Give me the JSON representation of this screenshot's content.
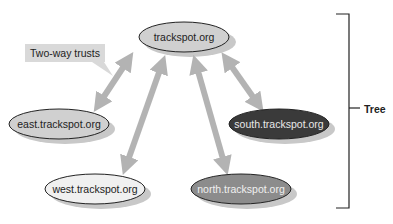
{
  "diagram": {
    "callout": "Two-way trusts",
    "bracket_label": "Tree",
    "nodes": [
      {
        "id": "root",
        "label": "trackspot.org",
        "fill": "#d0d0d0",
        "text_color": "#222222"
      },
      {
        "id": "east",
        "label": "east.trackspot.org",
        "fill": "#d0d0d0",
        "text_color": "#222222"
      },
      {
        "id": "south",
        "label": "south.trackspot.org",
        "fill": "#3a3a3a",
        "text_color": "#e8e8e8"
      },
      {
        "id": "west",
        "label": "west.trackspot.org",
        "fill": "#f0f0f0",
        "text_color": "#222222"
      },
      {
        "id": "north",
        "label": "north.trackspot.org",
        "fill": "#8c8c8c",
        "text_color": "#f0f0f0"
      }
    ],
    "edges": [
      {
        "from": "root",
        "to": "east",
        "type": "two-way"
      },
      {
        "from": "root",
        "to": "west",
        "type": "two-way"
      },
      {
        "from": "root",
        "to": "north",
        "type": "two-way"
      },
      {
        "from": "root",
        "to": "south",
        "type": "two-way"
      }
    ],
    "arrow_color": "#b3b3b3"
  }
}
